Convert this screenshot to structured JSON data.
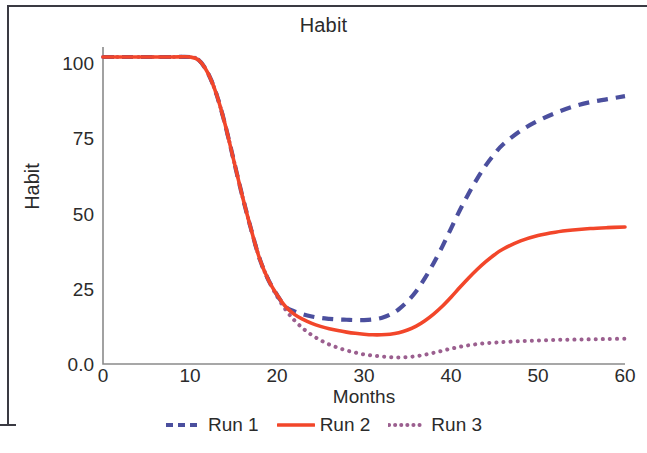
{
  "figure": {
    "title": "Habit"
  },
  "chart_data": {
    "type": "line",
    "title": "Habit",
    "xlabel": "Months",
    "ylabel": "Habit",
    "xlim": [
      0,
      60
    ],
    "ylim": [
      0,
      104
    ],
    "xticks": [
      "0",
      "10",
      "20",
      "30",
      "40",
      "50",
      "60"
    ],
    "xtick_values": [
      0,
      10,
      20,
      30,
      40,
      50,
      60
    ],
    "yticks": [
      "0.0",
      "25",
      "50",
      "75",
      "100"
    ],
    "ytick_values": [
      0,
      25,
      50,
      75,
      100
    ],
    "grid": false,
    "legend_position": "bottom",
    "x": [
      0,
      2,
      4,
      6,
      8,
      10,
      11,
      12,
      13,
      14,
      15,
      16,
      17,
      18,
      19,
      20,
      21,
      22,
      23,
      24,
      25,
      26,
      27,
      28,
      29,
      30,
      31,
      32,
      33,
      34,
      35,
      36,
      37,
      38,
      39,
      40,
      41,
      42,
      43,
      44,
      45,
      46,
      48,
      50,
      52,
      54,
      56,
      58,
      60
    ],
    "series": [
      {
        "name": "Run 1",
        "color": "#4b4f9e",
        "style": "dashed",
        "values": [
          102,
          102,
          102,
          102,
          102,
          102,
          101,
          97,
          90,
          80,
          68,
          56,
          45,
          35,
          28,
          23,
          19,
          17.5,
          16.5,
          15.8,
          15.3,
          15.0,
          14.8,
          14.7,
          14.6,
          14.6,
          14.8,
          15.3,
          16.4,
          18.2,
          20.8,
          24.2,
          28.5,
          33.5,
          39,
          45,
          51,
          56.5,
          61.5,
          66,
          69.8,
          73,
          77.5,
          80.8,
          83.4,
          85.5,
          87,
          88,
          89
        ]
      },
      {
        "name": "Run 2",
        "color": "#f2462a",
        "style": "solid",
        "values": [
          102,
          102,
          102,
          102,
          102,
          102,
          101,
          97,
          90,
          80,
          68,
          56,
          45,
          35,
          28,
          23,
          19,
          16.5,
          14.8,
          13.5,
          12.5,
          11.7,
          11.1,
          10.6,
          10.2,
          9.9,
          9.7,
          9.7,
          9.9,
          10.4,
          11.3,
          12.6,
          14.4,
          16.6,
          19.2,
          22.2,
          25.4,
          28.5,
          31.4,
          34,
          36.3,
          38.2,
          40.9,
          42.7,
          43.8,
          44.5,
          45,
          45.3,
          45.5
        ]
      },
      {
        "name": "Run 3",
        "color": "#9b5f8f",
        "style": "dotted",
        "values": [
          102,
          102,
          102,
          102,
          102,
          102,
          101,
          97,
          90,
          80,
          68,
          56,
          45,
          35,
          28,
          22.5,
          18,
          14.5,
          11.8,
          9.6,
          7.9,
          6.5,
          5.4,
          4.5,
          3.8,
          3.2,
          2.8,
          2.5,
          2.3,
          2.2,
          2.3,
          2.6,
          3.1,
          3.7,
          4.4,
          5.1,
          5.7,
          6.2,
          6.6,
          6.9,
          7.1,
          7.3,
          7.6,
          7.8,
          8.0,
          8.1,
          8.2,
          8.3,
          8.4
        ]
      }
    ]
  },
  "legend": {
    "items": [
      {
        "label": "Run 1"
      },
      {
        "label": "Run 2"
      },
      {
        "label": "Run 3"
      }
    ]
  },
  "axis": {
    "spine_color": "#8a8a8a"
  }
}
